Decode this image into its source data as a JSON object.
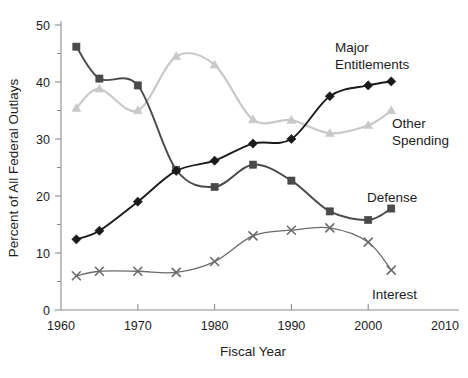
{
  "chart_data": {
    "type": "line",
    "title": "",
    "xlabel": "Fiscal Year",
    "ylabel": "Percent of All Federal Outlays",
    "xlim": [
      1960,
      2010
    ],
    "ylim": [
      0,
      50
    ],
    "grid": false,
    "legend_position": "inline-right-of-series",
    "x_ticks": [
      "1960",
      "1970",
      "1980",
      "1990",
      "2000",
      "2010"
    ],
    "x_tick_values": [
      1960,
      1970,
      1980,
      1990,
      2000,
      2010
    ],
    "y_ticks": [
      "0",
      "10",
      "20",
      "30",
      "40",
      "50"
    ],
    "y_tick_values": [
      0,
      10,
      20,
      30,
      40,
      50
    ],
    "y_minor_tick_values": [
      5,
      15,
      25,
      35,
      45
    ],
    "x": [
      1962,
      1965,
      1970,
      1975,
      1980,
      1985,
      1990,
      1995,
      2000,
      2003
    ],
    "series": [
      {
        "name": "Defense",
        "marker": "square",
        "color": "#4a4a4a",
        "line_color": "#4a4a4a",
        "values": [
          46.2,
          40.6,
          39.4,
          24.6,
          21.6,
          25.5,
          22.7,
          17.3,
          15.8,
          17.8
        ]
      },
      {
        "name": "Other Spending",
        "marker": "triangle",
        "color": "#c9c9c9",
        "line_color": "#c9c9c9",
        "values": [
          35.4,
          38.8,
          35.0,
          44.5,
          43.0,
          33.4,
          33.3,
          31.0,
          32.4,
          35.0
        ]
      },
      {
        "name": "Major Entitlements",
        "marker": "diamond",
        "color": "#1a1a1a",
        "line_color": "#1a1a1a",
        "values": [
          12.4,
          13.9,
          19.0,
          24.4,
          26.2,
          29.2,
          30.0,
          37.5,
          39.4,
          40.1
        ]
      },
      {
        "name": "Interest",
        "marker": "x",
        "color": "#6b6b6b",
        "line_color": "#6b6b6b",
        "values": [
          6.0,
          6.8,
          6.8,
          6.6,
          8.5,
          13.0,
          14.0,
          14.4,
          11.9,
          7.0
        ]
      }
    ],
    "annotations": [
      {
        "text": "Major",
        "x": 335,
        "y": 52,
        "name": "series-label-major-entitlements-line1"
      },
      {
        "text": "Entitlements",
        "x": 335,
        "y": 69,
        "name": "series-label-major-entitlements-line2"
      },
      {
        "text": "Other",
        "x": 392,
        "y": 128,
        "name": "series-label-other-spending-line1"
      },
      {
        "text": "Spending",
        "x": 392,
        "y": 145,
        "name": "series-label-other-spending-line2"
      },
      {
        "text": "Defense",
        "x": 367,
        "y": 202,
        "name": "series-label-defense"
      },
      {
        "text": "Interest",
        "x": 372,
        "y": 299,
        "name": "series-label-interest"
      }
    ]
  }
}
